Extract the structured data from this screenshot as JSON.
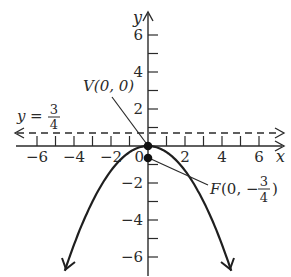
{
  "diagram": {
    "type": "parabola-graph",
    "equation_description": "Downward-opening parabola with vertex at origin, focus below, directrix above",
    "colors": {
      "ink": "#2a2a2a",
      "background": "#ffffff"
    },
    "axes": {
      "x_label": "x",
      "y_label": "y",
      "x_range": [
        -7,
        7
      ],
      "y_range": [
        -7,
        7
      ],
      "x_tick_labels": [
        {
          "value": -6,
          "text": "−6"
        },
        {
          "value": -4,
          "text": "−4"
        },
        {
          "value": -2,
          "text": "−2"
        },
        {
          "value": 0,
          "text": "0"
        },
        {
          "value": 2,
          "text": "2"
        },
        {
          "value": 4,
          "text": "4"
        },
        {
          "value": 6,
          "text": "6"
        }
      ],
      "y_tick_labels": [
        {
          "value": 6,
          "text": "6"
        },
        {
          "value": 4,
          "text": "4"
        },
        {
          "value": 2,
          "text": "2"
        },
        {
          "value": -2,
          "text": "−2"
        },
        {
          "value": -4,
          "text": "−4"
        },
        {
          "value": -6,
          "text": "−6"
        }
      ]
    },
    "vertex": {
      "label": "V(0, 0)",
      "x": 0,
      "y": 0
    },
    "focus": {
      "label_prefix": "F",
      "label_open": "(0, −",
      "label_num": "3",
      "label_den": "4",
      "label_close": ")",
      "x": 0,
      "y": -0.75
    },
    "directrix": {
      "label_lhs": "y",
      "label_eq": "=",
      "label_num": "3",
      "label_den": "4",
      "y": 0.75
    }
  }
}
